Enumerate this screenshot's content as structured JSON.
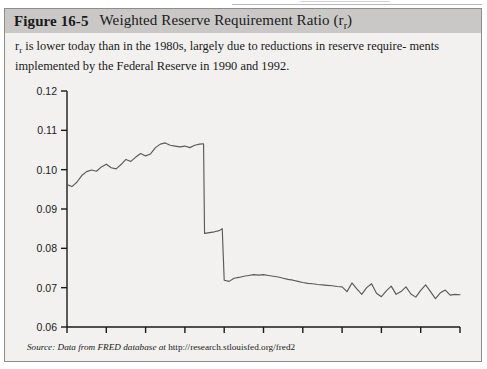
{
  "figure": {
    "number": "Figure 16-5",
    "title_before_sub": "Weighted Reserve Requirement Ratio (r",
    "title_sub": "r",
    "title_after_sub": ")",
    "caption_line1_a": "r",
    "caption_line1_sub": "r",
    "caption_line1_b": " is lower today than in the 1980s, largely due to reductions in reserve require-",
    "caption_line2": "ments implemented by the Federal Reserve in 1990 and 1992.",
    "source_italic": "Source: Data from FRED database at ",
    "source_url": "http://research.stlouisfed.org/fred2"
  },
  "colors": {
    "panel_background": "#f2f1ef",
    "title_bar": "#c9c8c6",
    "border": "#8d8d8d",
    "axis": "#1a1a1a",
    "line": "#5a5a5a",
    "text": "#1a1a1a"
  },
  "chart_data": {
    "type": "line",
    "xlabel": "",
    "ylabel": "",
    "xlim": [
      1984,
      2004
    ],
    "ylim": [
      0.06,
      0.12
    ],
    "xticks": [
      1984,
      1986,
      1988,
      1990,
      1992,
      1994,
      1996,
      1998,
      2000,
      2002,
      2004
    ],
    "xticklabels": [
      "1984",
      "1986",
      "1988",
      "1990",
      "1992",
      "1994",
      "1996",
      "1998",
      "2000",
      "2002",
      "2004"
    ],
    "yticks": [
      0.06,
      0.07,
      0.08,
      0.09,
      0.1,
      0.11,
      0.12
    ],
    "yticklabels": [
      "0.06",
      "0.07",
      "0.08",
      "0.09",
      "0.10",
      "0.11",
      "0.12"
    ],
    "grid": false,
    "legend": false,
    "series": [
      {
        "name": "Weighted reserve requirement ratio",
        "x": [
          1984.0,
          1984.25,
          1984.5,
          1984.75,
          1985.0,
          1985.25,
          1985.5,
          1985.75,
          1986.0,
          1986.25,
          1986.5,
          1986.75,
          1987.0,
          1987.25,
          1987.5,
          1987.75,
          1988.0,
          1988.25,
          1988.5,
          1988.75,
          1989.0,
          1989.25,
          1989.5,
          1989.75,
          1990.0,
          1990.25,
          1990.5,
          1990.75,
          1990.95,
          1991.0,
          1991.25,
          1991.5,
          1991.75,
          1991.9,
          1992.0,
          1992.25,
          1992.5,
          1992.75,
          1993.0,
          1993.25,
          1993.5,
          1993.75,
          1994.0,
          1994.25,
          1994.5,
          1994.75,
          1995.0,
          1995.25,
          1995.5,
          1995.75,
          1996.0,
          1996.25,
          1996.5,
          1996.75,
          1997.0,
          1997.25,
          1997.5,
          1997.75,
          1998.0,
          1998.25,
          1998.5,
          1998.75,
          1999.0,
          1999.25,
          1999.5,
          1999.75,
          2000.0,
          2000.25,
          2000.5,
          2000.75,
          2001.0,
          2001.25,
          2001.5,
          2001.75,
          2002.0,
          2002.25,
          2002.5,
          2002.75,
          2003.0,
          2003.25,
          2003.5,
          2003.75,
          2004.0
        ],
        "y": [
          0.0962,
          0.0957,
          0.0968,
          0.0985,
          0.0995,
          0.0999,
          0.0996,
          0.1007,
          0.1014,
          0.1005,
          0.1002,
          0.1013,
          0.1026,
          0.1021,
          0.1032,
          0.1041,
          0.1035,
          0.104,
          0.1056,
          0.1065,
          0.1068,
          0.1062,
          0.106,
          0.1058,
          0.106,
          0.1056,
          0.1062,
          0.1065,
          0.1066,
          0.0838,
          0.084,
          0.0842,
          0.0845,
          0.085,
          0.0719,
          0.0716,
          0.0724,
          0.0726,
          0.0729,
          0.0731,
          0.0733,
          0.0732,
          0.0733,
          0.0731,
          0.0729,
          0.0727,
          0.0724,
          0.0721,
          0.0719,
          0.0716,
          0.0713,
          0.0711,
          0.071,
          0.0708,
          0.0707,
          0.0706,
          0.0705,
          0.0703,
          0.0702,
          0.069,
          0.0712,
          0.0697,
          0.0683,
          0.07,
          0.071,
          0.0686,
          0.0677,
          0.0692,
          0.0704,
          0.0683,
          0.069,
          0.0702,
          0.0684,
          0.0676,
          0.0693,
          0.0707,
          0.069,
          0.0672,
          0.0687,
          0.0694,
          0.0681,
          0.0683,
          0.0682
        ]
      }
    ],
    "annotations": [
      "Sharp drop near 1990 from about 0.107 to about 0.084 (reserve requirement reduction)",
      "Second sharp drop near 1992 from about 0.085 to about 0.072"
    ]
  }
}
